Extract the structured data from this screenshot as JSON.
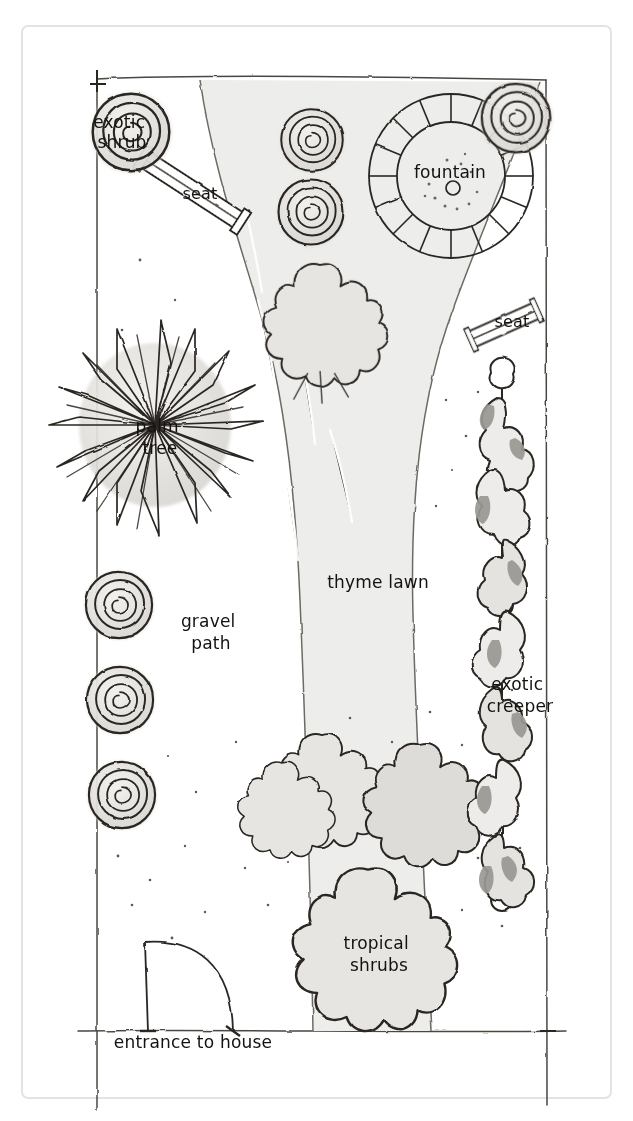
{
  "document": {
    "kind": "hand-drawn garden design plan",
    "title": "Garden layout plan",
    "orientation": "portrait",
    "page_background": "#ffffff",
    "ink_color": "#2a2622",
    "fill_light": "#e9e8e5",
    "fill_mid": "#cfcdc8",
    "fill_dark": "#a9a7a1"
  },
  "labels": [
    {
      "id": "exotic-shrub",
      "text": "exotic\nshrub",
      "lines": [
        "exotic",
        "shrub"
      ],
      "x": 122,
      "y": 128
    },
    {
      "id": "seat-left",
      "text": "seat",
      "lines": [
        "seat"
      ],
      "x": 200,
      "y": 199
    },
    {
      "id": "fountain",
      "text": "fountain",
      "lines": [
        "fountain"
      ],
      "x": 450,
      "y": 178
    },
    {
      "id": "seat-right",
      "text": "seat",
      "lines": [
        "seat"
      ],
      "x": 512,
      "y": 327
    },
    {
      "id": "palm-tree",
      "text": "palm\ntree",
      "lines": [
        "palm",
        "tree"
      ],
      "x": 160,
      "y": 432
    },
    {
      "id": "thyme-lawn",
      "text": "thyme lawn",
      "lines": [
        "thyme lawn"
      ],
      "x": 378,
      "y": 588
    },
    {
      "id": "gravel-path",
      "text": "gravel\npath",
      "lines": [
        "gravel",
        "path"
      ],
      "x": 211,
      "y": 627
    },
    {
      "id": "exotic-creeper",
      "text": "exotic\ncreeper",
      "lines": [
        "exotic",
        "creeper"
      ],
      "x": 520,
      "y": 690
    },
    {
      "id": "tropical-shrubs",
      "text": "tropical\nshrubs",
      "lines": [
        "tropical",
        "shrubs"
      ],
      "x": 379,
      "y": 949
    },
    {
      "id": "entrance",
      "text": "entrance to house",
      "lines": [
        "entrance to house"
      ],
      "x": 193,
      "y": 1048
    }
  ],
  "features": {
    "boundary": {
      "name": "garden boundary",
      "style": "thin wobbly ink line"
    },
    "fountain": {
      "name": "circular fountain with radial paving surround",
      "segments": 16
    },
    "seats": {
      "count": 2,
      "names": [
        "seat",
        "seat"
      ]
    },
    "gravel_path": {
      "name": "gravel path",
      "style": "curving S-shaped band, light grey fill"
    },
    "thyme_lawn": {
      "name": "thyme lawn",
      "style": "open area with scattered stipple dots"
    },
    "palm_tree": {
      "name": "palm tree",
      "style": "spiky starburst canopy"
    },
    "spiral_shrubs": {
      "count": 7,
      "name": "exotic shrub",
      "style": "spiral rose form, grey fill"
    },
    "tropical_shrubs": {
      "count": 5,
      "name": "tropical shrubs",
      "style": "lobed blobby canopies"
    },
    "exotic_creeper": {
      "name": "exotic creeper",
      "style": "climbs a vertical post-and-wire trellis"
    },
    "entrance": {
      "name": "entrance to house",
      "style": "door swing arc at south wall"
    }
  }
}
